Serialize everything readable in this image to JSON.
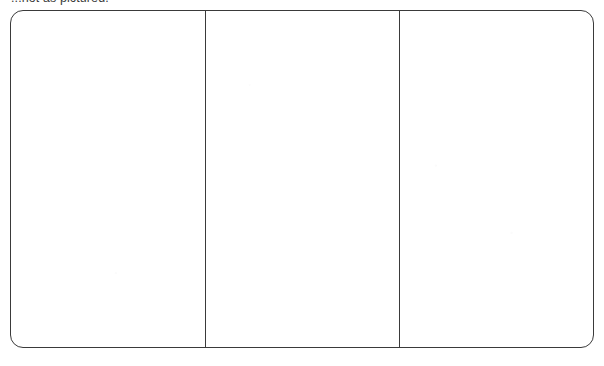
{
  "document": {
    "caption": "...not as pictured.",
    "caption_note": "clipped at top edge of scan"
  },
  "frame": {
    "stroke_color": "#3a3a3a",
    "fill_color": "#ffffff",
    "stroke_width_px": 1.5,
    "corner_radius_px": 13,
    "left_px": 10,
    "top_px": 10,
    "width_px": 584,
    "height_px": 338
  },
  "panels": [
    {
      "name": "left-panel",
      "label": "",
      "left_px": 0,
      "width_px": 194
    },
    {
      "name": "center-panel",
      "label": "",
      "left_px": 194,
      "width_px": 194
    },
    {
      "name": "right-panel",
      "label": "",
      "left_px": 388,
      "width_px": 196
    }
  ],
  "dividers": [
    {
      "name": "divider-1",
      "x_px": 194
    },
    {
      "name": "divider-2",
      "x_px": 388
    }
  ]
}
